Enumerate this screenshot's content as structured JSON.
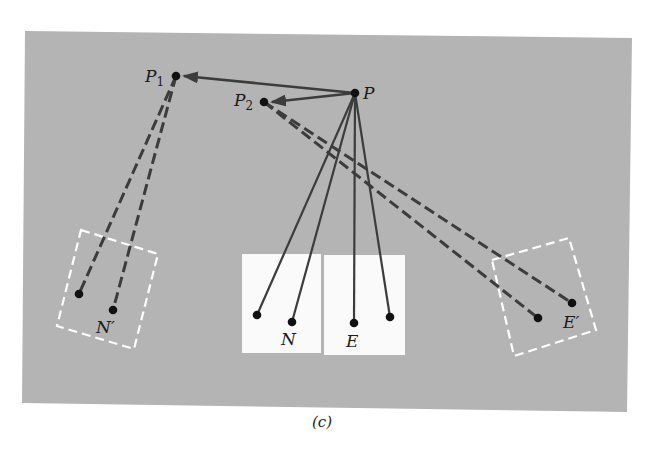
{
  "figure": {
    "caption": "(c)",
    "colors": {
      "panel": "#b4b4b4",
      "white_box": "#fafafa",
      "line": "#3c3c3c",
      "dashed_box": "#ffffff",
      "dot": "#111111"
    }
  },
  "points": {
    "P": {
      "label": "P",
      "x": 355,
      "y": 93
    },
    "P1": {
      "label": "P",
      "sub": "1",
      "x": 176,
      "y": 76
    },
    "P2": {
      "label": "P",
      "sub": "2",
      "x": 264,
      "y": 102
    }
  },
  "labels": {
    "N": "N",
    "E": "E",
    "N_prime": "N′",
    "E_prime": "E′"
  },
  "diagram": {
    "solid_lines_from_P": [
      {
        "x": 257,
        "y": 315
      },
      {
        "x": 292,
        "y": 322
      },
      {
        "x": 354,
        "y": 323
      },
      {
        "x": 390,
        "y": 317
      }
    ],
    "arrows": [
      {
        "from": "P",
        "to": "P1"
      },
      {
        "from": "P",
        "to": "P2"
      }
    ],
    "dashed_lines_from_P1": [
      {
        "x": 79,
        "y": 294
      },
      {
        "x": 113,
        "y": 310
      }
    ],
    "dashed_lines_from_P2": [
      {
        "x": 538,
        "y": 318
      },
      {
        "x": 572,
        "y": 303
      }
    ]
  }
}
